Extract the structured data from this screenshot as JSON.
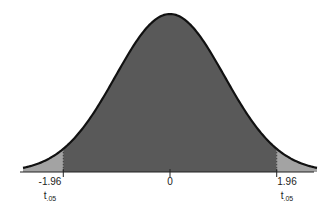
{
  "chart_data": {
    "type": "area",
    "title": "",
    "xlabel": "",
    "ylabel": "",
    "distribution": "standard normal (t) curve, two-tailed",
    "xlim": [
      -2.7,
      2.7
    ],
    "grid": false,
    "legend": null,
    "shaded_regions": [
      {
        "name": "left tail",
        "from": -2.7,
        "to": -1.96,
        "color": "#a3a3a3"
      },
      {
        "name": "center",
        "from": -1.96,
        "to": 1.96,
        "color": "#595959"
      },
      {
        "name": "right tail",
        "from": 1.96,
        "to": 2.7,
        "color": "#a3a3a3"
      }
    ],
    "ticks": [
      {
        "x": -1.96,
        "label": "-1.96",
        "sublabel_base": "t",
        "sublabel_sub": ".05"
      },
      {
        "x": 0,
        "label": "0"
      },
      {
        "x": 1.96,
        "label": "1.96",
        "sublabel_base": "t",
        "sublabel_sub": ".05"
      }
    ]
  },
  "labels": {
    "left_value": "-1.96",
    "left_t": "t",
    "left_sub": ".05",
    "center_value": "0",
    "right_value": "1.96",
    "right_t": "t",
    "right_sub": ".05"
  }
}
